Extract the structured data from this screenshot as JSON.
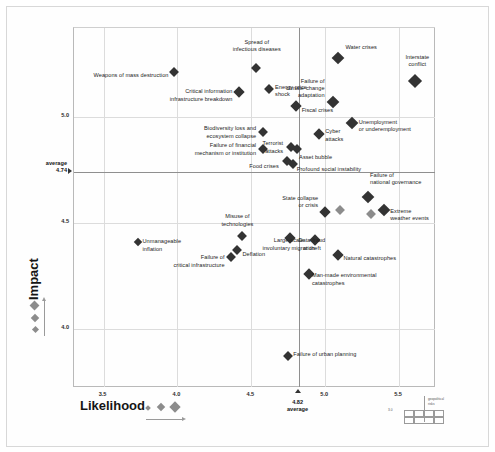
{
  "chart_data": {
    "type": "scatter",
    "title": "",
    "xlabel": "Likelihood",
    "ylabel": "Impact",
    "xlim": [
      3.3,
      5.75
    ],
    "ylim": [
      3.72,
      5.42
    ],
    "xticks": [
      "3.5",
      "4.0",
      "4.5",
      "5.0",
      "5.5"
    ],
    "xtick_values": [
      3.5,
      4.0,
      4.5,
      5.0,
      5.5
    ],
    "yticks": [
      "5.0",
      "4.5",
      "4.0"
    ],
    "ytick_values": [
      5.0,
      4.5,
      4.0
    ],
    "grid": true,
    "legend_position": "bottom-left",
    "average_x": {
      "value": 4.82,
      "label": "4.82",
      "caption": "average"
    },
    "average_y": {
      "value": 4.74,
      "label": "4.74",
      "caption": "average"
    },
    "points": [
      {
        "name": "Weapons of mass destruction",
        "x": 3.98,
        "y": 5.21,
        "size": 7,
        "shade": "dark",
        "lx": -5,
        "ly": 4,
        "align": "right"
      },
      {
        "name": "Spread of\ninfectious diseases",
        "x": 4.53,
        "y": 5.23,
        "size": 7,
        "shade": "dark",
        "lx": 2,
        "ly": -22,
        "align": "center"
      },
      {
        "name": "Water crises",
        "x": 5.09,
        "y": 5.28,
        "size": 9,
        "shade": "dark",
        "lx": 8,
        "ly": -9,
        "align": "left"
      },
      {
        "name": "Interstate\nconflict",
        "x": 5.61,
        "y": 5.17,
        "size": 10,
        "shade": "dark",
        "lx": 3,
        "ly": -20,
        "align": "center"
      },
      {
        "name": "Critical information\ninfrastructure breakdown",
        "x": 4.42,
        "y": 5.12,
        "size": 8,
        "shade": "dark",
        "lx": -6,
        "ly": 4,
        "align": "right"
      },
      {
        "name": "Energy price\nshock",
        "x": 4.62,
        "y": 5.13,
        "size": 7,
        "shade": "dark",
        "lx": 7,
        "ly": 2,
        "align": "left"
      },
      {
        "name": "Failure of\nclimate-change\nadaptation",
        "x": 5.05,
        "y": 5.07,
        "size": 9,
        "shade": "dark",
        "lx": -7,
        "ly": -14,
        "align": "right"
      },
      {
        "name": "Fiscal crises",
        "x": 4.8,
        "y": 5.05,
        "size": 8,
        "shade": "dark",
        "lx": 7,
        "ly": 5,
        "align": "left"
      },
      {
        "name": "Unemployment\nor underemployment",
        "x": 5.18,
        "y": 4.97,
        "size": 9,
        "shade": "dark",
        "lx": 8,
        "ly": 3,
        "align": "left"
      },
      {
        "name": "Biodiversity loss and\necosystem collapse",
        "x": 4.58,
        "y": 4.93,
        "size": 7,
        "shade": "dark",
        "lx": -6,
        "ly": 1,
        "align": "right"
      },
      {
        "name": "Cyber\nattacks",
        "x": 4.96,
        "y": 4.92,
        "size": 8,
        "shade": "dark",
        "lx": 7,
        "ly": 2,
        "align": "left"
      },
      {
        "name": "Terrorist\nattacks",
        "x": 4.77,
        "y": 4.86,
        "size": 7,
        "shade": "dark",
        "lx": -7,
        "ly": 1,
        "align": "right"
      },
      {
        "name": "Asset bubble",
        "x": 4.81,
        "y": 4.85,
        "size": 7,
        "shade": "dark",
        "lx": 3,
        "ly": 9,
        "align": "left"
      },
      {
        "name": "Failure of financial\nmechanism or institution",
        "x": 4.58,
        "y": 4.85,
        "size": 7,
        "shade": "dark",
        "lx": -6,
        "ly": 1,
        "align": "right"
      },
      {
        "name": "Food crises",
        "x": 4.74,
        "y": 4.79,
        "size": 7,
        "shade": "dark",
        "lx": -7,
        "ly": 6,
        "align": "right"
      },
      {
        "name": "Profound social instability",
        "x": 4.78,
        "y": 4.78,
        "size": 7,
        "shade": "dark",
        "lx": 5,
        "ly": 7,
        "align": "left"
      },
      {
        "name": "Failure of\nnational governance",
        "x": 5.29,
        "y": 4.62,
        "size": 9,
        "shade": "dark",
        "lx": 3,
        "ly": -18,
        "align": "left"
      },
      {
        "name": "State collapse\nor crisis",
        "x": 5.0,
        "y": 4.55,
        "size": 8,
        "shade": "dark",
        "lx": -6,
        "ly": -10,
        "align": "right"
      },
      {
        "name": "Extreme\nweather events",
        "x": 5.4,
        "y": 4.56,
        "size": 9,
        "shade": "dark",
        "lx": 7,
        "ly": 5,
        "align": "left"
      },
      {
        "name": "Misuse of\ntechnologies",
        "x": 4.44,
        "y": 4.44,
        "size": 7,
        "shade": "dark",
        "lx": -4,
        "ly": -15,
        "align": "center"
      },
      {
        "name": "Unmanageable\ninflation",
        "x": 3.73,
        "y": 4.41,
        "size": 6,
        "shade": "dark",
        "lx": 6,
        "ly": 4,
        "align": "left"
      },
      {
        "name": "Deflation",
        "x": 4.4,
        "y": 4.37,
        "size": 7,
        "shade": "dark",
        "lx": 7,
        "ly": 5,
        "align": "left"
      },
      {
        "name": "Large-scale\ninvoluntary migration",
        "x": 4.76,
        "y": 4.43,
        "size": 8,
        "shade": "dark",
        "lx": 0,
        "ly": 7,
        "align": "center"
      },
      {
        "name": "Data fraud\nor theft",
        "x": 4.93,
        "y": 4.42,
        "size": 8,
        "shade": "dark",
        "lx": -2,
        "ly": 5,
        "align": "center"
      },
      {
        "name": "Failure of\ncritical infrastructure",
        "x": 4.36,
        "y": 4.34,
        "size": 7,
        "shade": "dark",
        "lx": -5,
        "ly": 5,
        "align": "right"
      },
      {
        "name": "Natural catastrophes",
        "x": 5.09,
        "y": 4.35,
        "size": 8,
        "shade": "dark",
        "lx": 6,
        "ly": 5,
        "align": "left"
      },
      {
        "name": "Man-made environmental\ncatastrophes",
        "x": 4.89,
        "y": 4.26,
        "size": 8,
        "shade": "dark",
        "lx": 4,
        "ly": 6,
        "align": "left"
      },
      {
        "name": "Failure of urban planning",
        "x": 4.75,
        "y": 3.87,
        "size": 7,
        "shade": "dark",
        "lx": 6,
        "ly": -1,
        "align": "left"
      }
    ],
    "extra_markers": [
      {
        "x": 5.1,
        "y": 4.56,
        "size": 7,
        "shade": "light"
      },
      {
        "x": 5.31,
        "y": 4.54,
        "size": 7,
        "shade": "light"
      }
    ],
    "size_legend_vertical": {
      "sizes": [
        7,
        6,
        5
      ]
    },
    "size_legend_horizontal": {
      "sizes": [
        4,
        6,
        8
      ]
    }
  },
  "mini_legend": {
    "line1": "geopolitical",
    "line2": "risks",
    "tick": "3.0"
  }
}
